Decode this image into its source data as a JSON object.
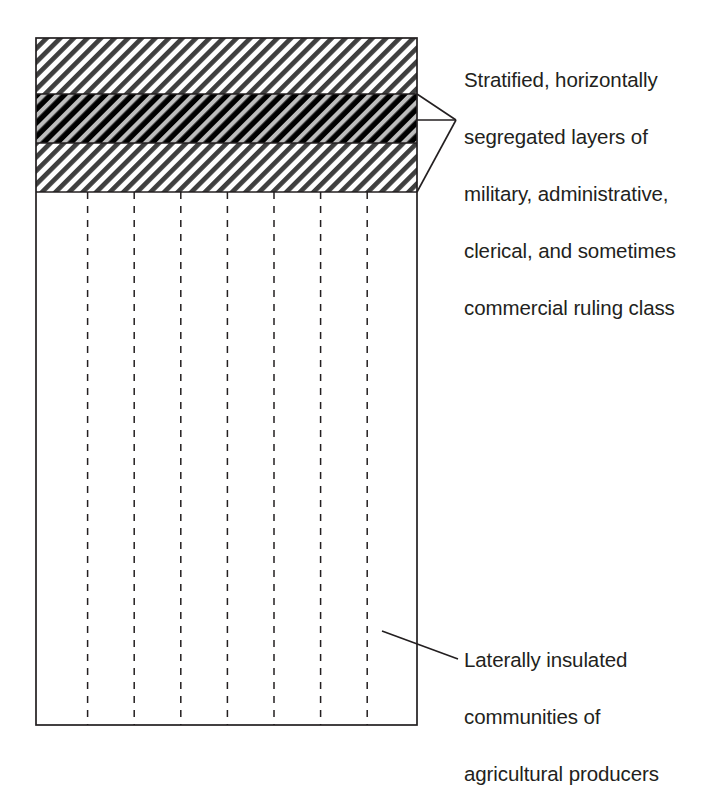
{
  "diagram": {
    "type": "layered-block-diagram",
    "canvas": {
      "width": 720,
      "height": 751,
      "background": "#ffffff"
    },
    "main_block": {
      "name": "society-block",
      "x": 36,
      "y": 38,
      "width": 381,
      "height": 687,
      "stroke": "#231f20",
      "stroke_width": 1.6,
      "fill": "#ffffff"
    },
    "bands": [
      {
        "id": "upper-ruling-band",
        "label": "upper hatched ruling layer",
        "y": 38,
        "height": 56,
        "pattern": "diagonal-hatch-light",
        "fill": "#ffffff",
        "stripe_color": "#3f3f3f"
      },
      {
        "id": "middle-ruling-band",
        "label": "middle dark hatched ruling layer",
        "y": 94,
        "height": 49,
        "pattern": "diagonal-hatch-dark",
        "fill": "#000000",
        "stripe_color": "#b9b9b9"
      },
      {
        "id": "lower-ruling-band",
        "label": "lower hatched ruling layer",
        "y": 143,
        "height": 49,
        "pattern": "diagonal-hatch-light",
        "fill": "#ffffff",
        "stripe_color": "#3f3f3f"
      },
      {
        "id": "producer-region",
        "label": "agricultural producer region",
        "y": 192,
        "height": 533,
        "pattern": "plain",
        "fill": "#ffffff",
        "stripe_color": ""
      }
    ],
    "community_dividers": {
      "name": "community-divider-lines",
      "count": 7,
      "style": "dashed",
      "stroke": "#231f20",
      "stroke_width": 1.5,
      "dash": "7 7",
      "x_positions": [
        87.6,
        134.2,
        180.8,
        227.4,
        274.0,
        320.6,
        367.2
      ],
      "y_top": 192,
      "y_bottom": 725
    },
    "leaders": {
      "ruling_class_bracket": {
        "name": "ruling-class-bracket-arrow",
        "apex_x": 456,
        "apex_y": 120,
        "top_x": 417,
        "top_y": 94,
        "bottom_x": 417,
        "bottom_y": 192,
        "mid_x": 417,
        "mid_y": 120,
        "stroke": "#231f20",
        "stroke_width": 1.6
      },
      "agricultural_leader": {
        "name": "agricultural-leader-line",
        "x1": 382,
        "y1": 631,
        "x2": 458,
        "y2": 659,
        "stroke": "#231f20",
        "stroke_width": 1.6
      }
    },
    "hatch": {
      "angle_degrees": 45,
      "direction": "lower-left to upper-right",
      "period_px": 9.6,
      "stripe_width_px": 4.6
    }
  },
  "annotations": {
    "ruling_class": {
      "name": "ruling-class-annotation",
      "full_text": "Stratified, horizontally segregated layers of military, administrative, clerical, and sometimes commercial ruling class",
      "lines": [
        "Stratified, horizontally",
        "segregated layers of",
        "military, administrative,",
        "clerical, and sometimes",
        "commercial ruling class"
      ]
    },
    "agricultural": {
      "name": "agricultural-annotation",
      "full_text": "Laterally insulated communities of agricultural producers",
      "lines": [
        "Laterally insulated",
        "communities of",
        "agricultural producers"
      ]
    }
  },
  "colors": {
    "ink": "#231f20",
    "paper": "#ffffff",
    "hatch_dark": "#3f3f3f",
    "band_black": "#000000",
    "hatch_light_on_black": "#b9b9b9"
  }
}
